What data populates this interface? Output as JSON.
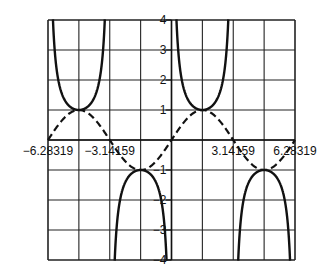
{
  "chart_data": {
    "type": "line",
    "title": "",
    "xlabel": "",
    "ylabel": "",
    "xlim": [
      -6.28319,
      6.28319
    ],
    "ylim": [
      -4,
      4
    ],
    "grid": true,
    "x_ticks": [
      -6.28319,
      -3.14159,
      3.14159,
      6.28319
    ],
    "x_tick_labels": [
      "-6.28319",
      "-3.14159",
      "3.14159",
      "6.28319"
    ],
    "y_ticks": [
      -4,
      -3,
      -2,
      -1,
      1,
      2,
      3,
      4
    ],
    "y_tick_labels": [
      "-4",
      "-3",
      "-2",
      "-1",
      "1",
      "2",
      "3",
      "4"
    ],
    "grid_columns": 8,
    "grid_rows": 8,
    "series": [
      {
        "name": "sin(x)",
        "style": "dashed",
        "function": "sin",
        "key_points": [
          {
            "x": -6.28319,
            "y": 0
          },
          {
            "x": -4.71239,
            "y": 1
          },
          {
            "x": -3.14159,
            "y": 0
          },
          {
            "x": -1.5708,
            "y": -1
          },
          {
            "x": 0,
            "y": 0
          },
          {
            "x": 1.5708,
            "y": 1
          },
          {
            "x": 3.14159,
            "y": 0
          },
          {
            "x": 4.71239,
            "y": -1
          },
          {
            "x": 6.28319,
            "y": 0
          }
        ]
      },
      {
        "name": "csc(x)",
        "style": "solid",
        "function": "csc",
        "key_points": [
          {
            "x": -4.71239,
            "y": 1
          },
          {
            "x": -1.5708,
            "y": -1
          },
          {
            "x": 1.5708,
            "y": 1
          },
          {
            "x": 4.71239,
            "y": -1
          }
        ],
        "asymptotes": [
          -6.28319,
          -3.14159,
          0,
          3.14159,
          6.28319
        ]
      }
    ],
    "colors": {
      "line": "#111111",
      "grid": "#222222",
      "background": "#ffffff"
    }
  }
}
